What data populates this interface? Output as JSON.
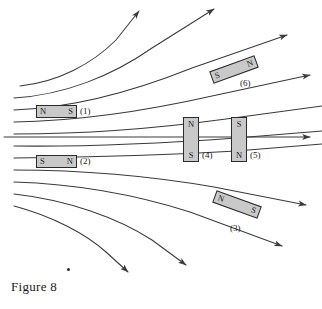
{
  "figure": {
    "caption": "Figure 8",
    "background_color": "#ffffff",
    "line_color": "#3a3a3a",
    "magnet_fill": "#c9c9c9",
    "magnet_border": "#2b2b2b"
  },
  "magnets": [
    {
      "id": "1",
      "label": "(1)",
      "orientation": "horizontal",
      "pole_start": "N",
      "pole_end": "S"
    },
    {
      "id": "2",
      "label": "(2)",
      "orientation": "horizontal",
      "pole_start": "S",
      "pole_end": "N"
    },
    {
      "id": "3",
      "label": "(3)",
      "orientation": "tilted-down-right",
      "pole_start": "N",
      "pole_end": "S"
    },
    {
      "id": "4",
      "label": "(4)",
      "orientation": "vertical",
      "pole_start": "N",
      "pole_end": "S"
    },
    {
      "id": "5",
      "label": "(5)",
      "orientation": "vertical",
      "pole_start": "S",
      "pole_end": "N"
    },
    {
      "id": "6",
      "label": "(6)",
      "orientation": "tilted-up-right",
      "pole_start": "S",
      "pole_end": "N"
    }
  ],
  "field_lines": {
    "count": 11,
    "direction": "left to right",
    "arrowheads": 9,
    "description": "fanning family of curves, straight horizontal center line"
  }
}
